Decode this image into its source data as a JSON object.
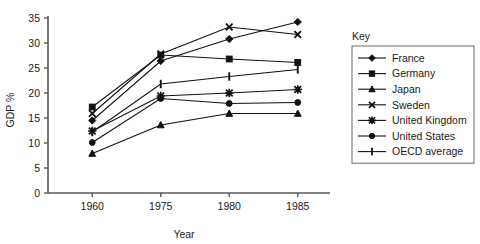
{
  "chart_data": {
    "type": "line",
    "title": "",
    "xlabel": "Year",
    "ylabel": "GDP %",
    "categories": [
      "1960",
      "1975",
      "1980",
      "1985"
    ],
    "x_tick_labels": [
      "1960",
      "1975",
      "1980",
      "1985"
    ],
    "y_tick_labels": [
      "0",
      "5",
      "10",
      "15",
      "20",
      "25",
      "30",
      "35"
    ],
    "y_ticks": [
      0,
      5,
      10,
      15,
      20,
      25,
      30,
      35
    ],
    "ylim": [
      0,
      35
    ],
    "grid": false,
    "legend_position": "right",
    "legend_title": "Key",
    "series": [
      {
        "name": "France",
        "marker": "diamond",
        "values": [
          14.5,
          26.4,
          30.8,
          34.2
        ]
      },
      {
        "name": "Germany",
        "marker": "square",
        "values": [
          17.2,
          27.6,
          26.8,
          26.1
        ]
      },
      {
        "name": "Japan",
        "marker": "triangle",
        "values": [
          7.9,
          13.6,
          15.9,
          15.9
        ]
      },
      {
        "name": "Sweden",
        "marker": "cross",
        "values": [
          15.9,
          27.8,
          33.2,
          31.7
        ]
      },
      {
        "name": "United Kingdom",
        "marker": "star",
        "values": [
          12.4,
          19.4,
          20.0,
          20.7
        ]
      },
      {
        "name": "United States",
        "marker": "circle",
        "values": [
          10.1,
          18.9,
          17.9,
          18.1
        ]
      },
      {
        "name": "OECD average",
        "marker": "plus",
        "values": [
          12.2,
          21.8,
          23.3,
          24.7
        ]
      }
    ],
    "colors": {
      "series": "#111111",
      "axis": "#58585a",
      "legend_border": "#6a6a6a"
    }
  }
}
